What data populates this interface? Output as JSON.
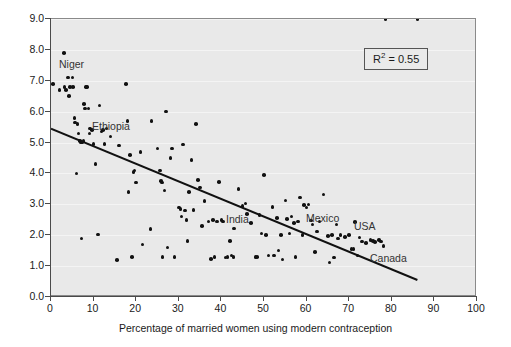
{
  "chart_data": {
    "type": "scatter",
    "title": "",
    "xlabel": "Percentage of married women using modern contraception",
    "ylabel": "",
    "xlim": [
      0,
      100
    ],
    "ylim": [
      0,
      9
    ],
    "xticks": [
      0,
      10,
      20,
      30,
      40,
      50,
      60,
      70,
      80,
      90,
      100
    ],
    "yticks": [
      "0.0",
      "1.0",
      "2.0",
      "3.0",
      "4.0",
      "5.0",
      "6.0",
      "7.0",
      "8.0",
      "9.0"
    ],
    "grid": true,
    "legend": "none",
    "annotations": [
      {
        "text": "R2 = 0.55",
        "display_text": "R",
        "sup": "2",
        "rest": " = 0.55",
        "x": 74,
        "y": 7.6
      }
    ],
    "trendline": {
      "label": "linear-regression",
      "x_start": 0,
      "y_start": 5.45,
      "x_end": 86,
      "y_end": 0.55
    },
    "point_labels": [
      {
        "name": "Niger",
        "px": 58,
        "py": 58
      },
      {
        "name": "Ethiopia",
        "px": 91,
        "py": 120
      },
      {
        "name": "India",
        "px": 225,
        "py": 213
      },
      {
        "name": "Mexico",
        "px": 305,
        "py": 212
      },
      {
        "name": "USA",
        "px": 353,
        "py": 220
      },
      {
        "name": "Canada",
        "px": 369,
        "py": 252
      }
    ],
    "x": [
      0.5,
      2.0,
      3.0,
      3.2,
      3.5,
      4.0,
      4.2,
      4.5,
      5.0,
      5.2,
      5.5,
      5.6,
      6.0,
      6.2,
      6.5,
      6.8,
      7.0,
      7.2,
      7.4,
      7.6,
      7.8,
      8.0,
      8.2,
      8.5,
      8.8,
      9.0,
      9.2,
      9.6,
      10.0,
      10.5,
      11.0,
      11.4,
      11.8,
      12.2,
      12.6,
      13.0,
      14.0,
      15.5,
      16.0,
      17.6,
      18.0,
      18.2,
      18.5,
      19.0,
      19.4,
      19.6,
      20.0,
      21.0,
      21.5,
      23.4,
      23.6,
      25.0,
      25.6,
      25.8,
      26.0,
      26.2,
      26.6,
      27.0,
      27.4,
      28.0,
      28.4,
      29.0,
      30.0,
      30.4,
      30.6,
      31.0,
      31.4,
      31.8,
      32.0,
      32.4,
      33.0,
      33.4,
      34.0,
      34.5,
      35.0,
      35.4,
      36.0,
      37.0,
      37.6,
      38.0,
      38.4,
      39.0,
      39.4,
      40.0,
      40.4,
      41.0,
      41.4,
      42.0,
      42.4,
      42.8,
      43.0,
      44.0,
      45.0,
      45.6,
      46.0,
      47.0,
      48.0,
      48.4,
      49.0,
      49.4,
      50.0,
      50.5,
      51.0,
      52.0,
      52.4,
      53.0,
      53.4,
      54.0,
      54.4,
      55.0,
      55.4,
      56.0,
      56.4,
      57.0,
      57.4,
      58.0,
      58.4,
      59.0,
      59.4,
      60.0,
      60.4,
      61.0,
      61.4,
      62.0,
      62.4,
      63.0,
      64.0,
      65.0,
      65.4,
      66.0,
      66.4,
      67.0,
      67.4,
      68.0,
      69.0,
      70.0,
      70.5,
      71.0,
      71.4,
      72.0,
      72.4,
      73.0,
      74.0,
      75.0,
      75.6,
      76.0,
      77.0,
      77.5,
      78.0,
      78.5,
      86.0
    ],
    "y": [
      6.9,
      6.7,
      7.9,
      6.8,
      6.7,
      7.1,
      6.5,
      6.8,
      7.1,
      6.8,
      5.8,
      5.65,
      4.0,
      5.6,
      5.3,
      5.05,
      5.0,
      1.9,
      5.0,
      5.05,
      6.25,
      6.1,
      6.8,
      6.8,
      6.1,
      5.3,
      5.45,
      5.4,
      4.95,
      4.3,
      2.02,
      6.2,
      5.35,
      5.4,
      4.95,
      5.45,
      5.2,
      1.2,
      4.9,
      6.9,
      5.7,
      3.4,
      4.6,
      1.3,
      4.05,
      4.1,
      3.7,
      4.7,
      1.7,
      2.2,
      5.7,
      4.8,
      4.1,
      3.75,
      3.7,
      1.3,
      3.45,
      6.0,
      1.6,
      4.5,
      4.8,
      1.3,
      2.9,
      2.85,
      2.6,
      4.93,
      2.8,
      2.5,
      1.82,
      3.4,
      4.43,
      2.82,
      5.6,
      3.78,
      3.55,
      2.3,
      3.1,
      2.45,
      1.23,
      2.5,
      1.3,
      2.45,
      3.72,
      2.5,
      2.45,
      1.28,
      1.3,
      1.82,
      1.35,
      1.3,
      2.22,
      3.5,
      2.95,
      3.02,
      2.68,
      2.4,
      1.3,
      1.3,
      2.65,
      2.05,
      3.95,
      2.0,
      1.35,
      2.92,
      1.35,
      2.55,
      1.5,
      2.0,
      1.22,
      3.12,
      2.52,
      2.05,
      2.6,
      2.4,
      1.3,
      2.45,
      3.22,
      2.0,
      2.98,
      2.9,
      3.0,
      2.48,
      2.35,
      1.45,
      2.12,
      2.45,
      3.32,
      1.98,
      1.12,
      2.0,
      1.28,
      2.35,
      1.9,
      2.0,
      1.95,
      2.0,
      1.55,
      1.55,
      2.42,
      1.35,
      1.92,
      1.8,
      1.75,
      1.85,
      1.82,
      1.78,
      1.85,
      1.8,
      1.65
    ]
  }
}
